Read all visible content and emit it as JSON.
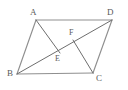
{
  "figure": {
    "background_color": "#ffffff",
    "outline_color": "#8f8f8f",
    "inner_color": "#6e6e6e",
    "label_color": "#5a5a5a",
    "canvas": {
      "width": 128,
      "height": 90
    },
    "vertices": [
      {
        "id": "A",
        "label": "A",
        "x": 36,
        "y": 20,
        "label_x": 30,
        "label_y": 8
      },
      {
        "id": "D",
        "label": "D",
        "x": 112,
        "y": 20,
        "label_x": 107,
        "label_y": 8
      },
      {
        "id": "B",
        "label": "B",
        "x": 17,
        "y": 74,
        "label_x": 7,
        "label_y": 69
      },
      {
        "id": "C",
        "label": "C",
        "x": 93,
        "y": 73,
        "label_x": 96,
        "label_y": 74
      }
    ],
    "interior_points": [
      {
        "id": "E",
        "label": "E",
        "x": 60,
        "y": 53,
        "label_x": 55,
        "label_y": 55
      },
      {
        "id": "F",
        "label": "F",
        "x": 73,
        "y": 40,
        "label_x": 69,
        "label_y": 29
      }
    ],
    "segments": [
      {
        "id": "AD",
        "from": "A",
        "to": "D",
        "kind": "edge",
        "x1": 36,
        "y1": 20,
        "x2": 112,
        "y2": 20
      },
      {
        "id": "BC",
        "from": "B",
        "to": "C",
        "kind": "edge",
        "x1": 17,
        "y1": 74,
        "x2": 93,
        "y2": 73
      },
      {
        "id": "AB",
        "from": "A",
        "to": "B",
        "kind": "edge",
        "x1": 36,
        "y1": 20,
        "x2": 17,
        "y2": 74
      },
      {
        "id": "DC",
        "from": "D",
        "to": "C",
        "kind": "edge",
        "x1": 112,
        "y1": 20,
        "x2": 93,
        "y2": 73
      },
      {
        "id": "BD",
        "from": "B",
        "to": "D",
        "kind": "inner",
        "x1": 17,
        "y1": 74,
        "x2": 112,
        "y2": 20
      },
      {
        "id": "AE",
        "from": "A",
        "to": "E",
        "kind": "inner",
        "x1": 36,
        "y1": 20,
        "x2": 60,
        "y2": 53
      },
      {
        "id": "CF",
        "from": "C",
        "to": "F",
        "kind": "inner",
        "x1": 93,
        "y1": 73,
        "x2": 73,
        "y2": 40
      }
    ]
  }
}
